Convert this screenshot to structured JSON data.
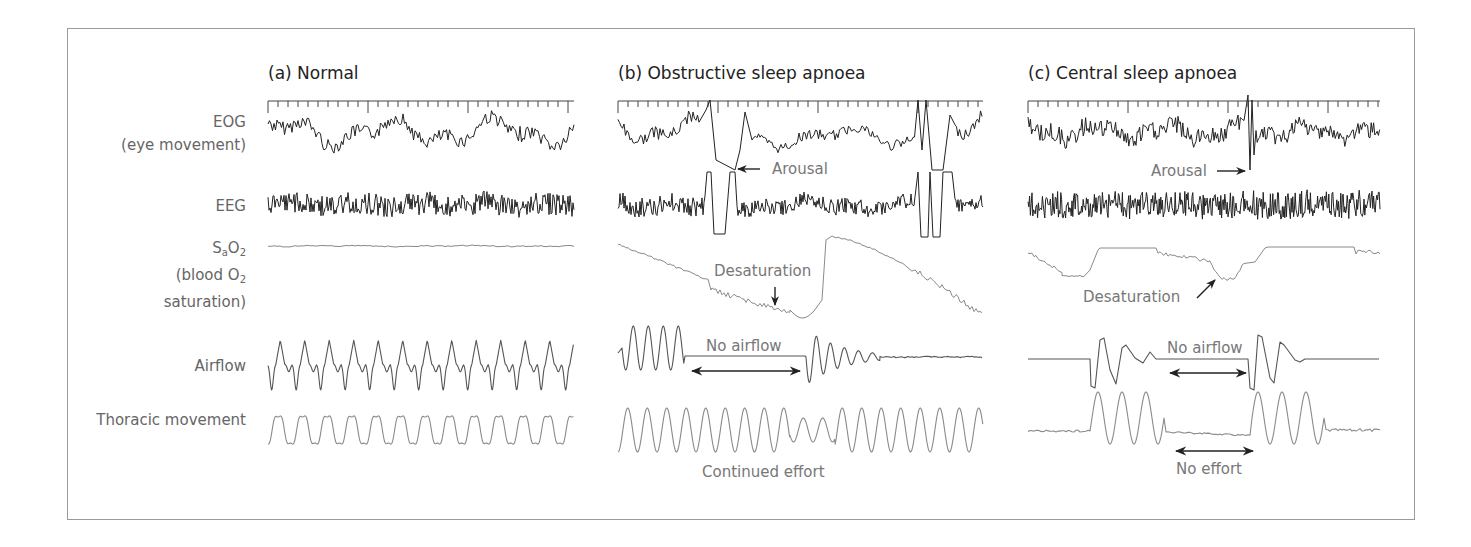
{
  "figure": {
    "frame_color": "#9a9a9a",
    "trace_dark": "#222222",
    "trace_mid": "#555555",
    "trace_light": "#8a8a8a",
    "label_color": "#666666"
  },
  "row_labels": {
    "eog_line1": "EOG",
    "eog_line2": "(eye movement)",
    "eeg": "EEG",
    "sao2_main": "S",
    "sao2_sub": "a",
    "sao2_rest": "O",
    "sao2_sub2": "2",
    "sao2_line2_main": "(blood O",
    "sao2_line2_sub": "2",
    "sao2_line3": "saturation)",
    "airflow": "Airflow",
    "thoracic": "Thoracic movement"
  },
  "panels": [
    {
      "id": "a",
      "title": "(a) Normal",
      "x0": 268,
      "x1": 574,
      "annotations": []
    },
    {
      "id": "b",
      "title": "(b) Obstructive sleep apnoea",
      "x0": 618,
      "x1": 983,
      "annotations": [
        {
          "key": "arousal",
          "text": "Arousal",
          "arrow": "left"
        },
        {
          "key": "desaturation",
          "text": "Desaturation",
          "arrow": "down"
        },
        {
          "key": "no_airflow",
          "text": "No airflow",
          "arrow": "double"
        },
        {
          "key": "continued_effort",
          "text": "Continued effort",
          "arrow": "none"
        }
      ]
    },
    {
      "id": "c",
      "title": "(c) Central sleep apnoea",
      "x0": 1028,
      "x1": 1380,
      "annotations": [
        {
          "key": "arousal",
          "text": "Arousal",
          "arrow": "right"
        },
        {
          "key": "desaturation",
          "text": "Desaturation",
          "arrow": "up-right"
        },
        {
          "key": "no_airflow",
          "text": "No airflow",
          "arrow": "double"
        },
        {
          "key": "no_effort",
          "text": "No effort",
          "arrow": "double"
        }
      ]
    }
  ],
  "annotations": {
    "b_arousal": "Arousal",
    "b_desaturation": "Desaturation",
    "b_no_airflow": "No airflow",
    "b_continued_effort": "Continued effort",
    "c_arousal": "Arousal",
    "c_desaturation": "Desaturation",
    "c_no_airflow": "No airflow",
    "c_no_effort": "No effort"
  },
  "ruler": {
    "y": 101,
    "tick_spacing": 10,
    "major_every": 10,
    "tick_len": 6,
    "major_len": 12
  },
  "rows": {
    "eog_y": 132,
    "eeg_y": 205,
    "sao2_y": 246,
    "airflow_y": 372,
    "thoracic_y": 428
  }
}
